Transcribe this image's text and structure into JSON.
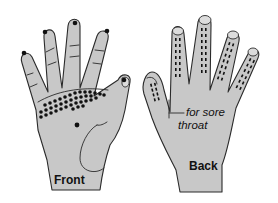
{
  "diagram": {
    "colors": {
      "skin": "#c8c8c8",
      "outline": "#2a2a2a",
      "points": "#111111",
      "background": "#ffffff"
    },
    "front": {
      "label": "Front",
      "marked_points": [
        "fingertip points",
        "upper palm cluster",
        "center palm point"
      ]
    },
    "back": {
      "label": "Back",
      "marked_points": [
        "dashed lines along fingers and thumb"
      ]
    },
    "annotation": {
      "line1": "for sore",
      "line2": "throat"
    }
  }
}
